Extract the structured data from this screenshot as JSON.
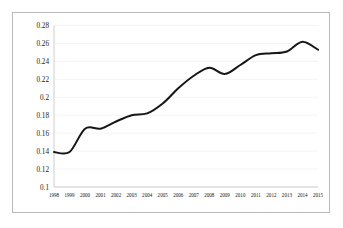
{
  "chart_data": {
    "type": "line",
    "title": "",
    "xlabel": "",
    "ylabel": "",
    "grid": true,
    "legend": false,
    "ylim": [
      0.1,
      0.28
    ],
    "ytick_step": 0.02,
    "yticks": [
      "0.28",
      "0.26",
      "0.24",
      "0.22",
      "0.2",
      "0.18",
      "0.16",
      "0.14",
      "0.12",
      "0.1"
    ],
    "categories": [
      "1998",
      "1999",
      "2000",
      "2001",
      "2002",
      "2003",
      "2004",
      "2005",
      "2006",
      "2007",
      "2008",
      "2009",
      "2010",
      "2011",
      "2012",
      "2013",
      "2014",
      "2015"
    ],
    "series": [
      {
        "name": "series-1",
        "color": "#161616",
        "values": [
          0.139,
          0.139,
          0.165,
          0.165,
          0.173,
          0.18,
          0.182,
          0.193,
          0.21,
          0.224,
          0.233,
          0.226,
          0.236,
          0.247,
          0.249,
          0.251,
          0.262,
          0.253
        ]
      }
    ]
  },
  "style": {
    "line_color": "#161616",
    "grid_color": "#ececec",
    "axis_color": "#c2c2c2",
    "border_color": "#b9b9b9",
    "background": "#ffffff",
    "text_color": "#1a1a1a"
  }
}
